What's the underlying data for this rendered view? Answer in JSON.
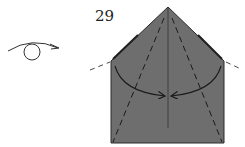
{
  "diagram": {
    "step_number": "29",
    "colors": {
      "paper": "#6e6e6e",
      "line": "#2a2a2a",
      "background": "#ffffff"
    },
    "symbols": [
      {
        "name": "turn-over",
        "description": "Turn model over"
      },
      {
        "name": "valley-fold-arrows",
        "description": "Fold both sides to center"
      },
      {
        "name": "mountain-fold-lines",
        "description": "Dashed extension lines at shoulders"
      }
    ]
  }
}
